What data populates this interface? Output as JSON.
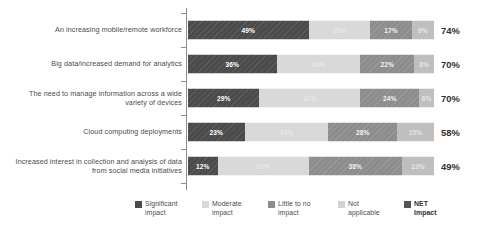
{
  "chart_data": {
    "type": "bar",
    "orientation": "horizontal",
    "stacked": true,
    "stack_total": 100,
    "title": "",
    "xlabel": "",
    "ylabel": "",
    "xlim": [
      0,
      100
    ],
    "grid": false,
    "legend_position": "bottom",
    "value_suffix": "%",
    "categories": [
      "An increasing mobile/remote workforce",
      "Big data/increased demand for analytics",
      "The need to manage information across a wide\nvariety of devices",
      "Cloud computing deployments",
      "Increased interest in collection and analysis of data\nfrom social media initiatives"
    ],
    "series": [
      {
        "name": "Significant impact",
        "color": "#4b4b4b",
        "hatch": "diagonal",
        "values": [
          49,
          36,
          29,
          23,
          12
        ]
      },
      {
        "name": "Moderate impact",
        "color": "#d9d9d9",
        "hatch": "none",
        "values": [
          25,
          34,
          41,
          34,
          37
        ]
      },
      {
        "name": "Little to no impact",
        "color": "#8d8d8d",
        "hatch": "diagonal",
        "values": [
          17,
          22,
          24,
          28,
          38
        ]
      },
      {
        "name": "Not applicable",
        "color": "#bfbfbf",
        "hatch": "none",
        "values": [
          9,
          8,
          6,
          15,
          13
        ]
      }
    ],
    "annotations": {
      "net_label": "NET Impact",
      "net_values": [
        "74%",
        "70%",
        "70%",
        "58%",
        "49%"
      ]
    },
    "bar_labels": [
      [
        "49%",
        "25%",
        "17%",
        "9%"
      ],
      [
        "36%",
        "34%",
        "22%",
        "8%"
      ],
      [
        "29%",
        "41%",
        "24%",
        "6%"
      ],
      [
        "23%",
        "34%",
        "28%",
        "15%"
      ],
      [
        "12%",
        "37%",
        "38%",
        "13%"
      ]
    ]
  },
  "legend": {
    "items": [
      {
        "label": "Significant\nimpact",
        "swatch": "s0",
        "bold": false
      },
      {
        "label": "Moderate\nimpact",
        "swatch": "s1",
        "bold": false
      },
      {
        "label": "Little to no\nimpact",
        "swatch": "s2",
        "bold": false
      },
      {
        "label": "Not\napplicable",
        "swatch": "s3",
        "bold": false
      },
      {
        "label": "NET\nImpact",
        "swatch": "s4",
        "bold": true
      }
    ]
  }
}
